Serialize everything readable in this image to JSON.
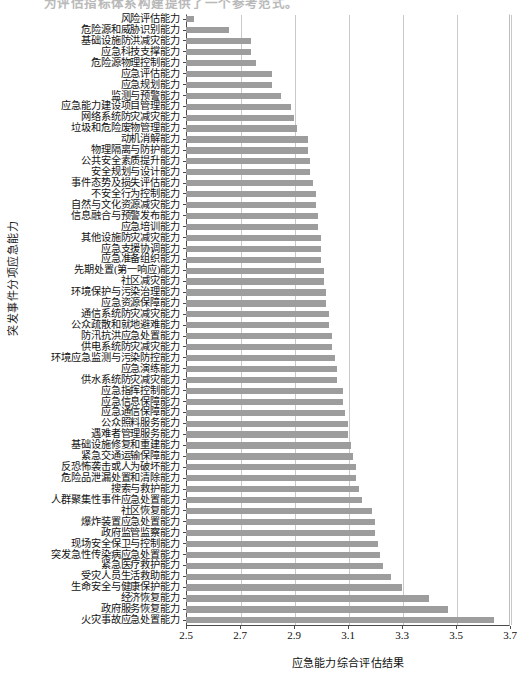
{
  "page": {
    "top_cut_text": "为评估指标体系构建提供了一个参考范式。"
  },
  "chart_data": {
    "type": "bar",
    "orientation": "horizontal",
    "title": "",
    "xlabel": "应急能力综合评估结果",
    "ylabel": "突发事件分项应急能力",
    "xlim": [
      2.5,
      3.7
    ],
    "xticks": [
      2.5,
      2.7,
      2.9,
      3.1,
      3.3,
      3.5,
      3.7
    ],
    "xtick_labels": [
      "2.5",
      "2.7",
      "2.9",
      "3.1",
      "3.3",
      "3.5",
      "3.7"
    ],
    "grid": "vertical",
    "legend": "none",
    "bar_color": "#9d9d9d",
    "categories": [
      "风险评估能力",
      "危险源和威胁识别能力",
      "基础设施防洪减灾能力",
      "应急科技支撑能力",
      "危险源物理控制能力",
      "应急评估能力",
      "应急规划能力",
      "监测与预警能力",
      "应急能力建设项目管理能力",
      "网络系统防灾减灾能力",
      "垃圾和危险废物管理能力",
      "动机消解能力",
      "物理隔离与防护能力",
      "公共安全素质提升能力",
      "安全规划与设计能力",
      "事件态势及损失评估能力",
      "不安全行为控制能力",
      "自然与文化资源减灾能力",
      "信息融合与预警发布能力",
      "应急培训能力",
      "其他设施防灾减灾能力",
      "应急支援协调能力",
      "应急准备组织能力",
      "先期处置(第一响应)能力",
      "社区减灾能力",
      "环境保护与污染治理能力",
      "应急资源保障能力",
      "通信系统防灾减灾能力",
      "公众疏散和就地避难能力",
      "防汛抗洪应急处置能力",
      "供电系统防灾减灾能力",
      "环境应急监测与污染防控能力",
      "应急演练能力",
      "供水系统防灾减灾能力",
      "应急指挥控制能力",
      "应急信息保障能力",
      "应急通信保障能力",
      "公众照料服务能力",
      "遇难者管理服务能力",
      "基础设施修复和重建能力",
      "紧急交通运输保障能力",
      "反恐怖袭击或人为破坏能力",
      "危险品泄漏处置和清除能力",
      "搜索与救护能力",
      "人群聚集性事件应急处置能力",
      "社区恢复能力",
      "爆炸装置应急处置能力",
      "政府监管监察能力",
      "现场安全保卫与控制能力",
      "突发急性传染病应急处置能力",
      "紧急医疗救护能力",
      "受灾人员生活救助能力",
      "生命安全与健康保护能力",
      "经济恢复能力",
      "政府服务恢复能力",
      "火灾事故应急处置能力"
    ],
    "values": [
      2.53,
      2.66,
      2.74,
      2.74,
      2.76,
      2.82,
      2.82,
      2.85,
      2.89,
      2.9,
      2.91,
      2.95,
      2.95,
      2.96,
      2.96,
      2.97,
      2.98,
      2.98,
      2.99,
      2.99,
      3.0,
      3.0,
      3.0,
      3.01,
      3.01,
      3.02,
      3.02,
      3.03,
      3.03,
      3.04,
      3.04,
      3.05,
      3.06,
      3.06,
      3.08,
      3.08,
      3.09,
      3.1,
      3.1,
      3.11,
      3.12,
      3.13,
      3.13,
      3.14,
      3.15,
      3.19,
      3.2,
      3.2,
      3.21,
      3.22,
      3.23,
      3.26,
      3.3,
      3.4,
      3.47,
      3.64
    ]
  }
}
